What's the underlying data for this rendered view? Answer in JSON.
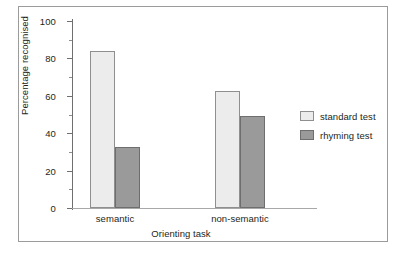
{
  "chart_data": {
    "type": "bar",
    "title": "",
    "xlabel": "Orienting task",
    "ylabel": "Percentage recognised",
    "categories": [
      "semantic",
      "non-semantic"
    ],
    "series": [
      {
        "name": "standard test",
        "values": [
          84,
          62.5
        ],
        "color": "#ececec"
      },
      {
        "name": "rhyming test",
        "values": [
          32.5,
          49
        ],
        "color": "#9a9a9a"
      }
    ],
    "ylim": [
      0,
      100
    ],
    "yticks": [
      0,
      20,
      40,
      60,
      80,
      100
    ],
    "yticks_minor": [
      10,
      30,
      50,
      70,
      90
    ],
    "ytick_labels": [
      "0",
      "20",
      "40",
      "60",
      "80",
      "100"
    ],
    "grid": false,
    "legend_position": "right"
  },
  "axes": {
    "y_title": "Percentage recognised",
    "x_title": "Orienting task",
    "y_labels": [
      "100",
      "80",
      "60",
      "40",
      "20",
      "0"
    ],
    "x_labels": [
      "semantic",
      "non-semantic"
    ]
  },
  "legend": {
    "items": [
      {
        "label": "standard test",
        "swatch": "light-swatch-icon"
      },
      {
        "label": "rhyming test",
        "swatch": "dark-swatch-icon"
      }
    ]
  },
  "caption": {
    "text": ""
  },
  "colors": {
    "standard_test": "#ececec",
    "rhyming_test": "#9a9a9a",
    "axis": "#6f6f6f",
    "frame": "#9b9b9b",
    "text": "#231f20"
  }
}
